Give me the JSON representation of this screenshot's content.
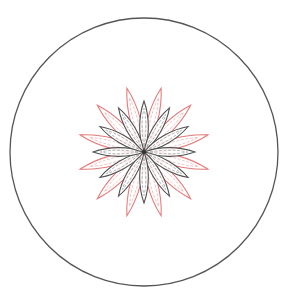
{
  "canvas": {
    "width": 294,
    "height": 302,
    "background": "#ffffff"
  },
  "outer_circle": {
    "cx": 144,
    "cy": 152,
    "r": 134,
    "stroke": "#555555",
    "stroke_width": 1.3
  },
  "flower": {
    "cx": 144,
    "cy": 152,
    "outer_petals": {
      "count": 12,
      "offset_deg": 15,
      "length": 66,
      "width": 13,
      "stroke": "#e67a7a",
      "vein_stroke": "#f0b0b0"
    },
    "inner_petals": {
      "count": 12,
      "offset_deg": 0,
      "length": 51,
      "width": 11,
      "stroke": "#505050",
      "vein_stroke": "#9a9a9a"
    }
  }
}
